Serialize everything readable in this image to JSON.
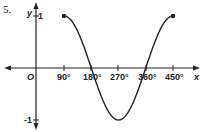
{
  "problem_number": "5.",
  "chart_data": {
    "type": "line",
    "title": "",
    "function": "y = sin x",
    "xlabel": "x",
    "ylabel": "y",
    "origin_label": "O",
    "x_ticks": [
      "90°",
      "180°",
      "270°",
      "360°",
      "450°"
    ],
    "y_ticks": [
      "1",
      "-1"
    ],
    "x": [
      90,
      135,
      180,
      225,
      270,
      315,
      360,
      405,
      450
    ],
    "y": [
      1,
      0.707,
      0,
      -0.707,
      -1,
      -0.707,
      0,
      0.707,
      1
    ],
    "endpoints": [
      {
        "x": 90,
        "y": 1
      },
      {
        "x": 450,
        "y": 1
      }
    ],
    "xlim": [
      -60,
      480
    ],
    "ylim": [
      -1.1,
      1.1
    ],
    "grid": false,
    "color": "#222222"
  }
}
